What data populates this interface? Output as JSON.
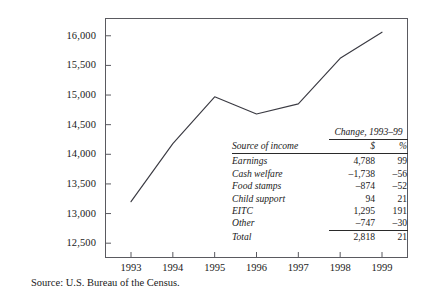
{
  "chart_data": {
    "type": "line",
    "title": "",
    "xlabel": "",
    "ylabel": "",
    "x": [
      "1993",
      "1994",
      "1995",
      "1996",
      "1997",
      "1998",
      "1999"
    ],
    "categories": [
      "1993",
      "1994",
      "1995",
      "1996",
      "1997",
      "1998",
      "1999"
    ],
    "values": [
      13200,
      14180,
      14970,
      14680,
      14850,
      15620,
      16060
    ],
    "series": [
      {
        "name": "Income",
        "values": [
          13200,
          14180,
          14970,
          14680,
          14850,
          15620,
          16060
        ]
      }
    ],
    "ylim": [
      12250,
      16300
    ],
    "yticks": [
      12500,
      13000,
      13500,
      14000,
      14500,
      15000,
      15500,
      16000
    ],
    "ytick_labels": [
      "12,500",
      "13,000",
      "13,500",
      "14,000",
      "14,500",
      "15,000",
      "15,500",
      "16,000"
    ],
    "xtick_labels": [
      "1993",
      "1994",
      "1995",
      "1996",
      "1997",
      "1998",
      "1999"
    ],
    "grid": false,
    "legend": "none",
    "line_color": "#3a3a42",
    "frame_color": "#5a5a60"
  },
  "source_note": "Source: U.S. Bureau of the Census.",
  "inset_table": {
    "group_header": "Change, 1993–99",
    "col_label_header": "Source of income",
    "col_dollar_header": "$",
    "col_pct_header": "%",
    "rows": [
      {
        "label": "Earnings",
        "dollar": "4,788",
        "pct": "99"
      },
      {
        "label": "Cash welfare",
        "dollar": "–1,738",
        "pct": "–56"
      },
      {
        "label": "Food stamps",
        "dollar": "–874",
        "pct": "–52"
      },
      {
        "label": "Child support",
        "dollar": "94",
        "pct": "21"
      },
      {
        "label": "EITC",
        "dollar": "1,295",
        "pct": "191"
      },
      {
        "label": "Other",
        "dollar": "–747",
        "pct": "–30"
      }
    ],
    "total_row": {
      "label": "Total",
      "dollar": "2,818",
      "pct": "21"
    }
  }
}
